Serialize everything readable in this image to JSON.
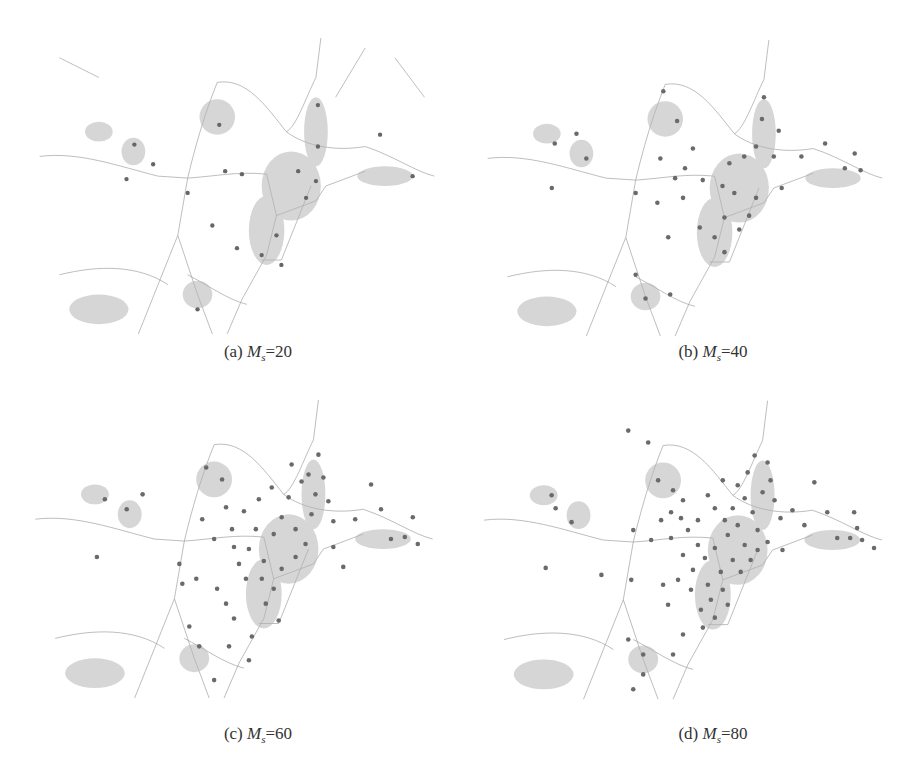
{
  "figure": {
    "panels": [
      {
        "id": "a",
        "label": "(a)",
        "param_symbol": "M",
        "param_sub": "s",
        "param_value": "20",
        "marker_count_approx": 20
      },
      {
        "id": "b",
        "label": "(b)",
        "param_symbol": "M",
        "param_sub": "s",
        "param_value": "40",
        "marker_count_approx": 40
      },
      {
        "id": "c",
        "label": "(c)",
        "param_symbol": "M",
        "param_sub": "s",
        "param_value": "60",
        "marker_count_approx": 60
      },
      {
        "id": "d",
        "label": "(d)",
        "param_symbol": "M",
        "param_sub": "s",
        "param_value": "80",
        "marker_count_approx": 80
      }
    ],
    "colors": {
      "road": "#9a9a9a",
      "road_major": "#707070",
      "marker": "#6a6a6a",
      "marker_dark": "#333333",
      "background": "#ffffff"
    }
  }
}
